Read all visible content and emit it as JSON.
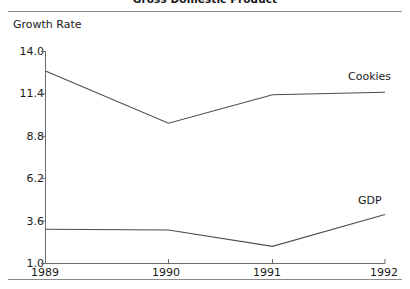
{
  "chart_data": {
    "type": "line",
    "title": "Gross Domestic Product",
    "xlabel": "",
    "ylabel": "Growth Rate",
    "x": [
      "1989",
      "1990",
      "1991",
      "1992"
    ],
    "categories": [
      "1989",
      "1990",
      "1991",
      "1992"
    ],
    "series": [
      {
        "name": "Cookies",
        "values": [
          12.8,
          9.6,
          11.35,
          11.5
        ]
      },
      {
        "name": "GDP",
        "values": [
          3.1,
          3.05,
          2.05,
          4.0
        ]
      }
    ],
    "yticks": [
      "14.0",
      "11.4",
      "8.8",
      "6.2",
      "3.6",
      "1.0"
    ],
    "ytick_values": [
      14.0,
      11.4,
      8.8,
      6.2,
      3.6,
      1.0
    ],
    "ylim": [
      1.0,
      14.0
    ],
    "grid": false,
    "legend": "inline-series-labels",
    "line_color": "#4d4d4d"
  },
  "axis": {
    "y_title": "Growth Rate",
    "ticks_y": [
      "14.0",
      "11.4",
      "8.8",
      "6.2",
      "3.6",
      "1.0"
    ],
    "ticks_x": [
      "1989",
      "1990",
      "1991",
      "1992"
    ]
  },
  "labels": {
    "cookies": "Cookies",
    "gdp": "GDP"
  },
  "header": {
    "title": "Gross Domestic Product"
  }
}
